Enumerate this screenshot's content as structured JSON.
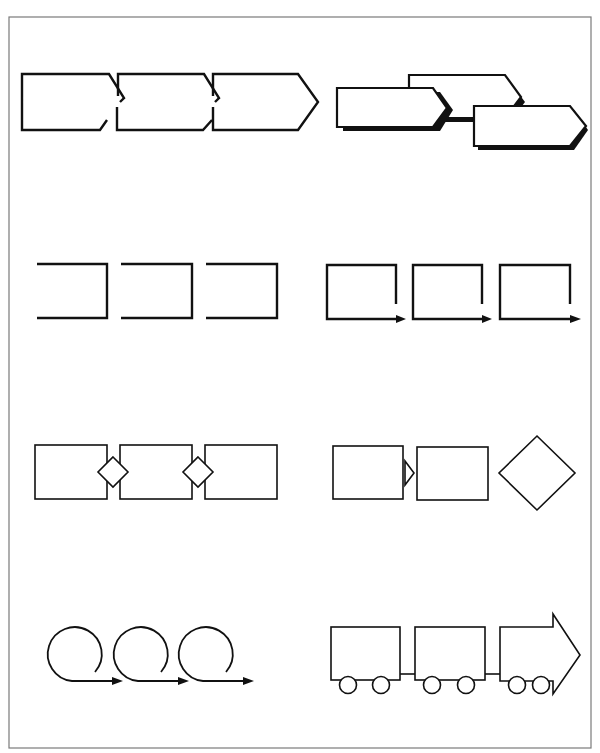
{
  "page": {
    "title": "",
    "colors": {
      "stroke": "#111111",
      "frame": "#7a7a7a",
      "background": "#ffffff"
    }
  },
  "rows": [
    {
      "id": "row-1",
      "groups": [
        {
          "name": "interlocking-chevron-arrows",
          "shape": "notched-pentagon-arrow",
          "count": 3,
          "label": ""
        },
        {
          "name": "staggered-shadow-arrows",
          "shape": "pentagon-arrow-with-shadow",
          "count": 3,
          "label": ""
        }
      ]
    },
    {
      "id": "row-2",
      "groups": [
        {
          "name": "open-left-brackets",
          "shape": "open-bracket",
          "count": 3,
          "label": ""
        },
        {
          "name": "bracket-arrows",
          "shape": "open-box-with-arrow",
          "count": 3,
          "label": ""
        }
      ]
    },
    {
      "id": "row-3",
      "groups": [
        {
          "name": "diamond-linked-boxes",
          "shape": "rectangle-with-diamond-connector",
          "count": 3,
          "label": ""
        },
        {
          "name": "boxes-to-decision",
          "shape": "rectangle-triangle-rectangle-diamond",
          "count": 3,
          "label": ""
        }
      ]
    },
    {
      "id": "row-4",
      "groups": [
        {
          "name": "loop-arrows",
          "shape": "circle-loop-arrow",
          "count": 3,
          "label": ""
        },
        {
          "name": "train-cars",
          "shape": "train-car-with-arrow-engine",
          "count": 3,
          "label": ""
        }
      ]
    }
  ]
}
